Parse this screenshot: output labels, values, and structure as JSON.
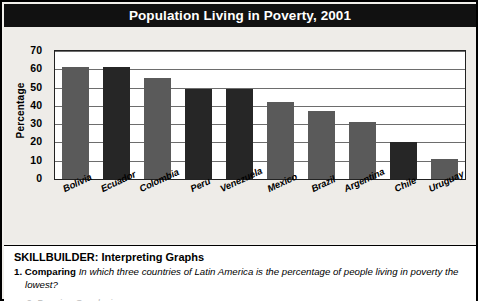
{
  "title": "Population Living in Poverty, 2001",
  "source": {
    "label": "Source: ",
    "title": "Social Panorama of Latin America, 2001–2002"
  },
  "skillbuilder": {
    "heading": "SKILLBUILDER: Interpreting Graphs",
    "question_number": "1.",
    "question_type": "Comparing",
    "question_text": "In which three countries of Latin America is the percentage of people living in poverty the lowest?",
    "clipped_next_line": "2. Drawing Conclusions"
  },
  "colors": {
    "title_bar": "#111111",
    "title_text": "#ffffff",
    "panel_background": "#eeece8",
    "plot_background": "#ffffff",
    "gridline": "#6d6d6d",
    "bar_light": "#5a5a5a",
    "bar_dark": "#262626"
  },
  "chart_data": {
    "type": "bar",
    "title": "Population Living in Poverty, 2001",
    "xlabel": "",
    "ylabel": "Percentage",
    "ylim": [
      0,
      70
    ],
    "yticks": [
      0,
      10,
      20,
      30,
      40,
      50,
      60,
      70
    ],
    "ytick_labels": [
      "0",
      "10",
      "20",
      "30",
      "40",
      "50",
      "60",
      "70"
    ],
    "grid": true,
    "legend": "none",
    "categories": [
      "Bolivia",
      "Ecuador",
      "Colombia",
      "Peru",
      "Venezuela",
      "Mexico",
      "Brazil",
      "Argentina",
      "Chile",
      "Uruguay"
    ],
    "values": [
      61,
      61,
      55,
      49,
      49,
      42,
      37,
      31,
      20,
      11
    ],
    "bar_colors": [
      "#5a5a5a",
      "#262626",
      "#5a5a5a",
      "#262626",
      "#262626",
      "#5a5a5a",
      "#5a5a5a",
      "#5a5a5a",
      "#262626",
      "#5a5a5a"
    ]
  }
}
